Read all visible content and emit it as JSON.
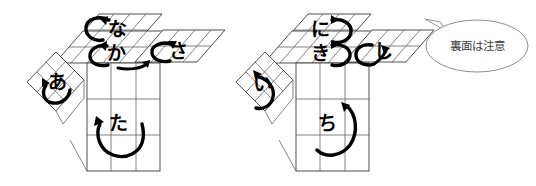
{
  "figure": {
    "background_color": "#ffffff",
    "line_color": "#3a3a3a",
    "ink_color": "#000000"
  },
  "cubes": [
    {
      "id": "left-cube",
      "name": "left-cube",
      "faces": [
        {
          "key": "top-back",
          "label": "な",
          "romaji": "na",
          "arrow": "ccw-loop-up"
        },
        {
          "key": "top-front",
          "label": "か",
          "romaji": "ka",
          "arrow": "ccw-loop-down"
        },
        {
          "key": "right-top",
          "label": "さ",
          "romaji": "sa",
          "arrow": "ccw-loop-left"
        },
        {
          "key": "left-side",
          "label": "あ",
          "romaji": "a",
          "arrow": "u-loop-left"
        },
        {
          "key": "front",
          "label": "た",
          "romaji": "ta",
          "arrow": "u-loop-up"
        }
      ]
    },
    {
      "id": "right-cube",
      "name": "right-cube",
      "faces": [
        {
          "key": "top-back",
          "label": "に",
          "romaji": "ni",
          "arrow": "cw-loop-up"
        },
        {
          "key": "top-front",
          "label": "き",
          "romaji": "ki",
          "arrow": "cw-loop-up"
        },
        {
          "key": "right-top",
          "label": "し",
          "romaji": "shi",
          "arrow": "cw-loop-right"
        },
        {
          "key": "left-side",
          "label": "い",
          "romaji": "i",
          "arrow": "u-loop-up-left"
        },
        {
          "key": "front",
          "label": "ち",
          "romaji": "chi",
          "arrow": "u-loop-up"
        }
      ]
    }
  ],
  "callout": {
    "name": "speech-bubble",
    "text": "裏面は注意",
    "border_color": "#8f8f8f",
    "text_color": "#3c3c3c"
  }
}
